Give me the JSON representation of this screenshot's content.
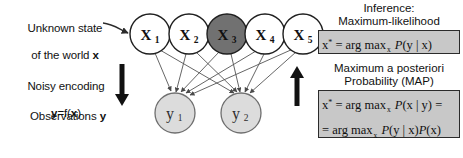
{
  "figure": {
    "background": "#ffffff"
  },
  "labels": {
    "unknown_state_line1": "Unknown state",
    "unknown_state_line2": "of the world ",
    "unknown_state_var": "x",
    "noisy_encoding_line1": "Noisy encoding",
    "noisy_encoding_line2_pre": "y",
    "noisy_encoding_line2_mid": "=f(",
    "noisy_encoding_line2_var": "x",
    "noisy_encoding_line2_post": ")",
    "observations_text": "Observations ",
    "observations_var": "y"
  },
  "inference": {
    "title": "Inference:",
    "ml_subtitle": "Maximum-likelihood",
    "ml_formula": {
      "lhs": "x",
      "star": "*",
      "eq": "= arg max",
      "under": "x",
      "prob": "P",
      "args": "(y | x)"
    },
    "map_title_line1": "Maximum a posteriori",
    "map_title_line2": "Probability (MAP)",
    "map_formula_line1": {
      "lhs": "x",
      "star": "*",
      "eq": "= arg max",
      "under": "x",
      "prob": "P",
      "args": "(x | y) ="
    },
    "map_formula_line2": {
      "eq": "= arg max",
      "under": "x",
      "prob": "P",
      "args": "(y | x)",
      "prob2": "P",
      "args2": "(x)"
    }
  },
  "graph": {
    "x_nodes": [
      {
        "id": "x1",
        "label": "X",
        "sub": "1",
        "cx": 150,
        "cy": 34,
        "r": 20,
        "fill": "#ffffff",
        "stroke": "#1f1f1f"
      },
      {
        "id": "x2",
        "label": "X",
        "sub": "2",
        "cx": 189,
        "cy": 34,
        "r": 20,
        "fill": "#ffffff",
        "stroke": "#1f1f1f"
      },
      {
        "id": "x3",
        "label": "X",
        "sub": "3",
        "cx": 227,
        "cy": 34,
        "r": 20,
        "fill": "#717171",
        "stroke": "#1f1f1f"
      },
      {
        "id": "x4",
        "label": "X",
        "sub": "4",
        "cx": 265,
        "cy": 34,
        "r": 20,
        "fill": "#ffffff",
        "stroke": "#1f1f1f"
      },
      {
        "id": "x5",
        "label": "X",
        "sub": "5",
        "cx": 303,
        "cy": 34,
        "r": 20,
        "fill": "#ffffff",
        "stroke": "#1f1f1f"
      }
    ],
    "y_nodes": [
      {
        "id": "y1",
        "label": "y",
        "sub": "1",
        "cx": 175,
        "cy": 113,
        "r": 20,
        "fill": "#dcdcdc",
        "stroke": "#6e6e6e"
      },
      {
        "id": "y2",
        "label": "y",
        "sub": "2",
        "cx": 241,
        "cy": 113,
        "r": 20,
        "fill": "#dcdcdc",
        "stroke": "#6e6e6e"
      }
    ],
    "edges": [
      {
        "from": "x1",
        "to": "y1"
      },
      {
        "from": "x1",
        "to": "y2"
      },
      {
        "from": "x2",
        "to": "y1"
      },
      {
        "from": "x2",
        "to": "y2"
      },
      {
        "from": "x3",
        "to": "y1"
      },
      {
        "from": "x3",
        "to": "y2"
      },
      {
        "from": "x4",
        "to": "y1"
      },
      {
        "from": "x4",
        "to": "y2"
      },
      {
        "from": "x5",
        "to": "y1"
      },
      {
        "from": "x5",
        "to": "y2"
      }
    ],
    "down_arrow": {
      "x": 122,
      "y_top": 64,
      "y_bottom": 104
    },
    "up_arrow": {
      "x": 297,
      "y_top": 66,
      "y_bottom": 106
    }
  },
  "colors": {
    "node_observed": "#717171",
    "node_hidden": "#ffffff",
    "node_y": "#dcdcdc",
    "box_fill": "#c8c8c8",
    "stroke": "#1f1f1f",
    "text": "#111111"
  }
}
